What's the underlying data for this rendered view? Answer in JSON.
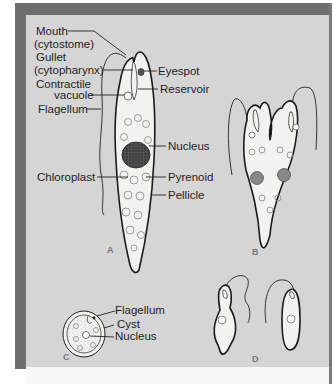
{
  "figure": {
    "panels": [
      {
        "id": "A",
        "label": "A"
      },
      {
        "id": "B",
        "label": "B"
      },
      {
        "id": "C",
        "label": "C"
      },
      {
        "id": "D",
        "label": "D"
      }
    ],
    "labels_a": {
      "mouth": "Mouth",
      "mouth_sub": "(cytostome)",
      "gullet": "Gullet",
      "gullet_sub": "(cytopharynx)",
      "contractile": "Contractile",
      "contractile_sub": "vacuole",
      "flagellum": "Flagellum",
      "eyespot": "Eyespot",
      "reservoir": "Reservoir",
      "nucleus": "Nucleus",
      "chloroplast": "Chloroplast",
      "pyrenoid": "Pyrenoid",
      "pellicle": "Pellicle"
    },
    "labels_c": {
      "flagellum": "Flagellum",
      "cyst": "Cyst",
      "nucleus": "Nucleus"
    },
    "colors": {
      "panel_bg": "#d5d5d5",
      "frame": "#6e6e6e",
      "cell_fill": "#f2f2f0",
      "nucleus": "#3a3a3a"
    }
  }
}
